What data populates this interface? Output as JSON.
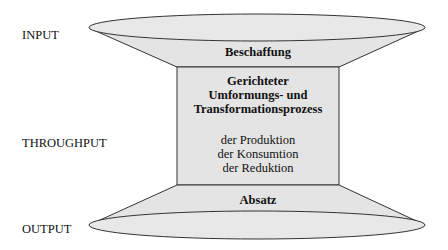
{
  "diagram": {
    "type": "hourglass-process-model",
    "colors": {
      "fill": "#e4e4e4",
      "stroke": "#333333",
      "text": "#111111",
      "background": "#ffffff"
    },
    "side_labels": {
      "input": "INPUT",
      "throughput": "THROUGHPUT",
      "output": "OUTPUT"
    },
    "top_section": {
      "label": "Beschaffung"
    },
    "middle_section": {
      "title_lines": [
        "Gerichteter",
        "Umformungs- und",
        "Transformationsprozess"
      ],
      "items": [
        "der Produktion",
        "der Konsumtion",
        "der Reduktion"
      ]
    },
    "bottom_section": {
      "label": "Absatz"
    }
  }
}
